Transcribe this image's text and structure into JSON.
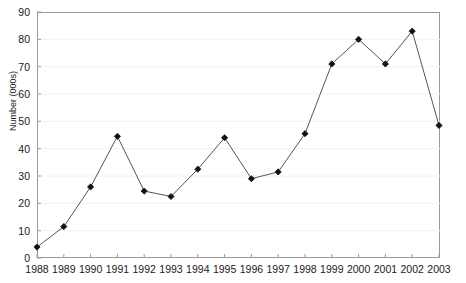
{
  "chart_data": {
    "type": "line",
    "title": "",
    "xlabel": "",
    "ylabel": "Number (000s)",
    "ylim": [
      0,
      90
    ],
    "ytick_step": 10,
    "yticks": [
      0,
      10,
      20,
      30,
      40,
      50,
      60,
      70,
      80,
      90
    ],
    "grid": "faint-horizontal",
    "legend": "none",
    "marker": "filled-diamond",
    "line_color": "#555555",
    "marker_color": "#111111",
    "axis_color": "#9a9a9a",
    "categories": [
      "1988",
      "1989",
      "1990",
      "1991",
      "1992",
      "1993",
      "1994",
      "1995",
      "1996",
      "1997",
      "1998",
      "1999",
      "2000",
      "2001",
      "2002",
      "2003"
    ],
    "values": [
      4,
      11.5,
      26,
      44.5,
      24.5,
      22.5,
      32.5,
      44,
      29,
      31.5,
      45.5,
      71,
      80,
      71,
      83,
      48.5
    ],
    "series": [
      {
        "name": "Number (000s)",
        "values": [
          4,
          11.5,
          26,
          44.5,
          24.5,
          22.5,
          32.5,
          44,
          29,
          31.5,
          45.5,
          71,
          80,
          71,
          83,
          48.5
        ]
      }
    ]
  }
}
